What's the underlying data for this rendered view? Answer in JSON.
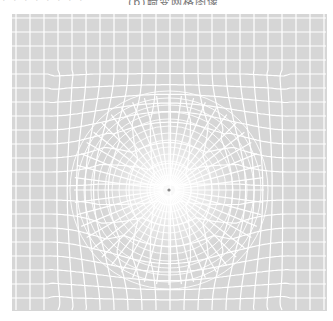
{
  "caption": {
    "left_fragment": "· · · · · · · ·",
    "right_fragment": "(b)畸变网格图像"
  },
  "figure": {
    "background_color": "#d6d6d6",
    "line_color": "#ffffff",
    "center": [
      169,
      190
    ],
    "grid_bounds": {
      "x0": 12,
      "y0": 14,
      "x1": 327,
      "y1": 311
    }
  }
}
